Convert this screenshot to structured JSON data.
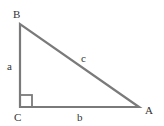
{
  "diagram": {
    "type": "right-triangle",
    "stroke_color": "#7a7a7a",
    "label_color": "#333333",
    "vertices": {
      "B": {
        "label": "B"
      },
      "C": {
        "label": "C"
      },
      "A": {
        "label": "A"
      }
    },
    "sides": {
      "a": {
        "label": "a"
      },
      "b": {
        "label": "b"
      },
      "c": {
        "label": "c"
      }
    },
    "right_angle_at": "C"
  }
}
